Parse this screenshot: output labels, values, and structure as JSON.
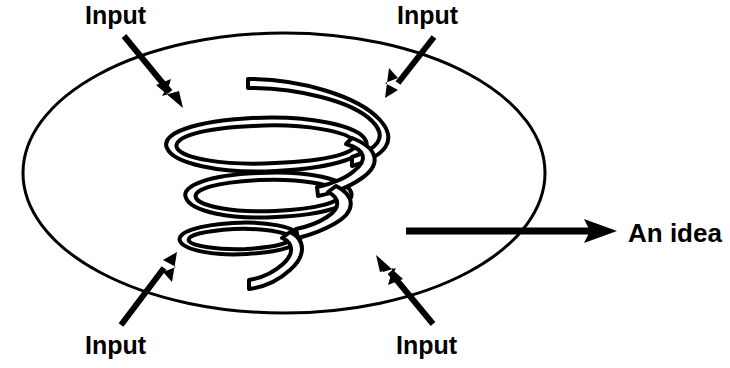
{
  "diagram": {
    "background_color": "#ffffff",
    "stroke_color": "#000000",
    "container": {
      "shape": "ellipse",
      "name": "process-boundary-ellipse",
      "cx": 284,
      "cy": 173,
      "rx": 261,
      "ry": 140,
      "stroke_width": 3
    },
    "spiral": {
      "name": "spiral-coil",
      "description": "three-turn conical/cylindrical helix drawn as an outlined tube",
      "turns": 3,
      "tube_outline": true,
      "stroke_width": 4,
      "tube_width": 9
    },
    "input_arrows": [
      {
        "id": "input-top-left",
        "label": "Input",
        "label_x": 85,
        "label_y": 24,
        "from_x": 124,
        "from_y": 36,
        "to_x": 182,
        "to_y": 107,
        "direction": "down-right"
      },
      {
        "id": "input-top-right",
        "label": "Input",
        "label_x": 397,
        "label_y": 24,
        "from_x": 434,
        "from_y": 37,
        "to_x": 386,
        "to_y": 97,
        "direction": "down-left"
      },
      {
        "id": "input-bottom-left",
        "label": "Input",
        "label_x": 85,
        "label_y": 354,
        "from_x": 121,
        "from_y": 325,
        "to_x": 176,
        "to_y": 253,
        "direction": "up-right"
      },
      {
        "id": "input-bottom-right",
        "label": "Input",
        "label_x": 396,
        "label_y": 354,
        "from_x": 433,
        "from_y": 324,
        "to_x": 377,
        "to_y": 256,
        "direction": "up-left"
      }
    ],
    "output_arrow": {
      "id": "output-an-idea",
      "label": "An idea",
      "label_x": 628,
      "label_y": 242,
      "from_x": 406,
      "from_y": 231,
      "to_x": 617,
      "to_y": 231,
      "direction": "right",
      "line_width": 7
    }
  }
}
